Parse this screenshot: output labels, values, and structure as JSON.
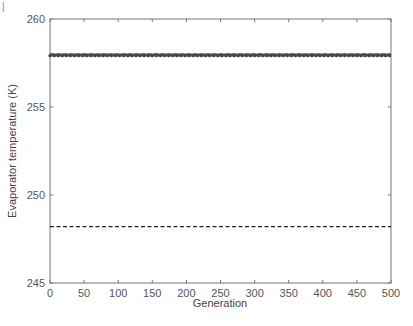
{
  "chart_data": {
    "type": "line",
    "title": "",
    "xlabel": "Generation",
    "ylabel": "Evaporator temperature (K)",
    "xlim": [
      0,
      500
    ],
    "ylim": [
      245,
      260
    ],
    "xticks": [
      0,
      50,
      100,
      150,
      200,
      250,
      300,
      350,
      400,
      450,
      500
    ],
    "yticks": [
      245,
      250,
      255,
      260
    ],
    "grid": false,
    "legend": null,
    "series": [
      {
        "name": "upper bound",
        "style": "dashed",
        "color": "#222222",
        "x": [
          0,
          500
        ],
        "y": [
          258.0,
          258.0
        ]
      },
      {
        "name": "evaporator temperature (per generation)",
        "style": "solid-with-markers",
        "color": "#555555",
        "x": [
          0,
          500
        ],
        "y": [
          257.95,
          257.95
        ]
      },
      {
        "name": "lower bound",
        "style": "dashed",
        "color": "#222222",
        "x": [
          0,
          500
        ],
        "y": [
          248.2,
          248.2
        ]
      }
    ]
  },
  "corner_mark": "|"
}
